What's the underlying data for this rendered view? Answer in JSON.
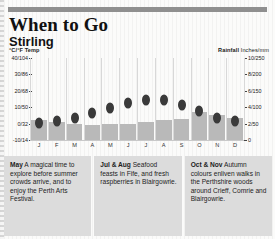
{
  "header": {
    "rule": "divider",
    "title": "When to Go",
    "subtitle": "Stirling"
  },
  "legend": {
    "temp_label": "°C/°F",
    "temp_word": "Temp",
    "rain_label": "Rainfall",
    "rain_word": "Inches/mm"
  },
  "chart_data": {
    "type": "bar",
    "subtitle": "Stirling",
    "xlabel": "",
    "ylabel": "°C/°F Temp",
    "y2label": "Rainfall Inches/mm",
    "grid": false,
    "legend_position": "top",
    "categories": [
      "J",
      "F",
      "M",
      "A",
      "M",
      "J",
      "J",
      "A",
      "S",
      "O",
      "N",
      "D"
    ],
    "months_full": [
      "January",
      "February",
      "March",
      "April",
      "May",
      "June",
      "July",
      "August",
      "September",
      "October",
      "November",
      "December"
    ],
    "yticks_left": [
      "40/104",
      "30/86",
      "20/68",
      "10/50",
      "0/32",
      "-10/14"
    ],
    "yticks_left_values": [
      40,
      30,
      20,
      10,
      0,
      -10
    ],
    "ylim": [
      -10,
      40
    ],
    "yticks_right": [
      "10/250",
      "8/200",
      "6/150",
      "4/100",
      "2/50",
      "0"
    ],
    "yticks_right_values": [
      10,
      8,
      6,
      4,
      2,
      0
    ],
    "y2lim": [
      0,
      10
    ],
    "series": [
      {
        "name": "Rainfall",
        "unit": "inches",
        "type": "bar",
        "color": "#b9b9b9",
        "values": [
          2.4,
          2.2,
          2.0,
          1.8,
          1.9,
          2.0,
          2.2,
          2.4,
          2.6,
          3.4,
          3.0,
          2.7
        ]
      },
      {
        "name": "Temp",
        "unit": "°C",
        "type": "scatter",
        "color": "#3a3a3a",
        "values": [
          4,
          5,
          7,
          10,
          13,
          16,
          18,
          18,
          15,
          11,
          7,
          5
        ]
      }
    ]
  },
  "tips": [
    {
      "month": "May",
      "text": " A magical time to explore before summer crowds arrive, and to enjoy the Perth Arts Festival."
    },
    {
      "month": "Jul & Aug",
      "text": " Seafood feasts in Fife, and fresh raspberries in Blairgowrie."
    },
    {
      "month": "Oct & Nov",
      "text": " Autumn colours enliven walks in the Perthshire woods around Crieff, Comrie and Blairgowrie."
    }
  ]
}
